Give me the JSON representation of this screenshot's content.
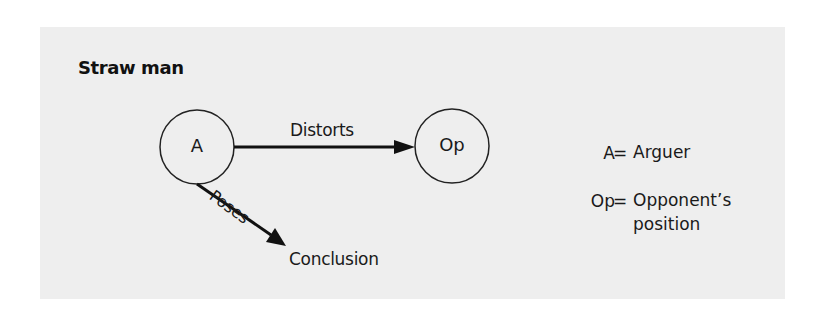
{
  "diagram": {
    "title": "Straw man",
    "nodes": [
      {
        "id": "A",
        "label": "A",
        "cx": 197,
        "cy": 147,
        "r": 37
      },
      {
        "id": "Op",
        "label": "Op",
        "cx": 452,
        "cy": 146,
        "r": 37
      }
    ],
    "edges": [
      {
        "from": "A",
        "to": "Op",
        "label": "Distorts"
      },
      {
        "from": "A",
        "to": "Conclusion",
        "label": "Poses"
      }
    ],
    "terminal_label": "Conclusion",
    "legend": [
      {
        "key": "A",
        "eq": "=",
        "value_line1": "Arguer",
        "value_line2": ""
      },
      {
        "key": "Op",
        "eq": "=",
        "value_line1": "Opponent’s",
        "value_line2": "position"
      }
    ],
    "colors": {
      "panel_background": "#eeeeee",
      "ink": "#1a1a1a",
      "page_background": "#ffffff"
    }
  }
}
